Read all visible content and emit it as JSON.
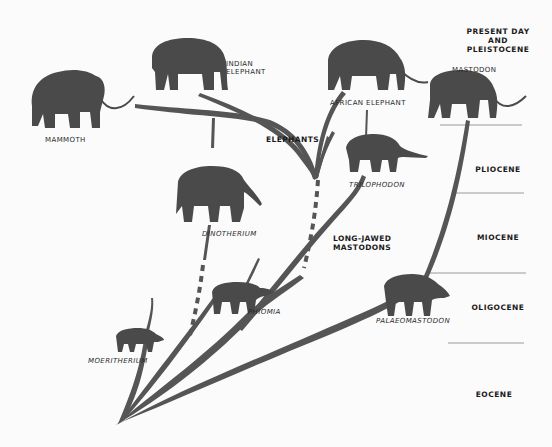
{
  "diagram": {
    "colors": {
      "background": "#fbfbfb",
      "silhouette": "#4a4a4a",
      "branch": "#555555",
      "text": "#1e1e1e",
      "divider": "#999999"
    },
    "eras": [
      {
        "id": "present",
        "lines": [
          "PRESENT DAY",
          "AND",
          "PLEISTOCENE"
        ]
      },
      {
        "id": "pliocene",
        "label": "PLIOCENE"
      },
      {
        "id": "miocene",
        "label": "MIOCENE"
      },
      {
        "id": "oligocene",
        "label": "OLIGOCENE"
      },
      {
        "id": "eocene",
        "label": "EOCENE"
      }
    ],
    "groups": {
      "elephants": "ELEPHANTS",
      "long_jawed": [
        "LONG-JAWED",
        "MASTODONS"
      ]
    },
    "animals": {
      "mammoth": "MAMMOTH",
      "indian": [
        "INDIAN",
        "ELEPHANT"
      ],
      "african": "AFRICAN ELEPHANT",
      "mastodon": "MASTODON",
      "trilophodon": "TRILOPHODON",
      "dinotherium": "DINOTHERIUM",
      "phiomia": "PHIOMIA",
      "palaeomastodon": "PALAEOMASTODON",
      "moeritherium": "MOERITHERIUM"
    }
  }
}
